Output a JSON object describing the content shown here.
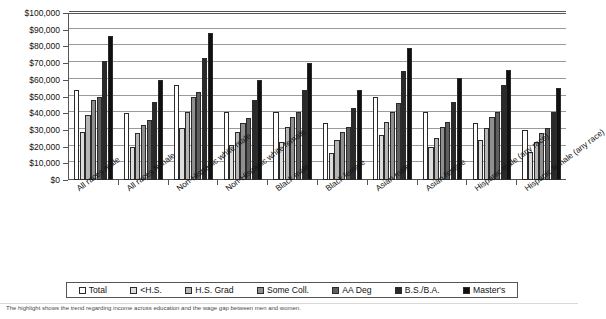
{
  "chart_data": {
    "type": "bar",
    "title": "",
    "subtitle": "",
    "xlabel": "",
    "ylabel": "",
    "ylim": [
      0,
      100000
    ],
    "ytick_values": [
      0,
      10000,
      20000,
      30000,
      40000,
      50000,
      60000,
      70000,
      80000,
      90000,
      100000
    ],
    "ytick_labels": [
      "$0",
      "$10,000",
      "$20,000",
      "$30,000",
      "$40,000",
      "$50,000",
      "$60,000",
      "$70,000",
      "$80,000",
      "$90,000",
      "$100,000"
    ],
    "grid": true,
    "legend_position": "bottom",
    "categories": [
      "All races male",
      "All races female",
      "Non-Hispanic white male",
      "Non-Hispanic white female",
      "Black male",
      "Black female",
      "Asian male",
      "Asian female",
      "Hispanic male (any race)",
      "Hispanic female (any race)"
    ],
    "series": [
      {
        "name": "Total",
        "color": "#ffffff",
        "values": [
          54000,
          40000,
          57000,
          41000,
          41000,
          34000,
          50000,
          41000,
          34000,
          30000
        ]
      },
      {
        "name": "<H.S.",
        "color": "#dcdcdc",
        "values": [
          29000,
          20000,
          31000,
          21000,
          23000,
          16000,
          27000,
          20000,
          24000,
          17000
        ]
      },
      {
        "name": "H.S. Grad",
        "color": "#b5b5b5",
        "values": [
          39000,
          28000,
          41000,
          29000,
          32000,
          24000,
          35000,
          25000,
          31000,
          23000
        ]
      },
      {
        "name": "Some Coll.",
        "color": "#8f8f8f",
        "values": [
          48000,
          33000,
          50000,
          34000,
          38000,
          29000,
          41000,
          32000,
          38000,
          28000
        ]
      },
      {
        "name": "AA Deg",
        "color": "#5e5e5e",
        "values": [
          50000,
          36000,
          53000,
          37000,
          41000,
          32000,
          46000,
          35000,
          41000,
          31000
        ]
      },
      {
        "name": "B.S./B.A.",
        "color": "#2a2a2a",
        "values": [
          71000,
          47000,
          73000,
          48000,
          54000,
          43000,
          65000,
          47000,
          57000,
          41000
        ]
      },
      {
        "name": "Master's",
        "color": "#101010",
        "values": [
          86000,
          60000,
          88000,
          60000,
          70000,
          54000,
          79000,
          61000,
          66000,
          55000
        ]
      }
    ]
  },
  "legend": {
    "items": [
      {
        "label": "Total"
      },
      {
        "label": "<H.S."
      },
      {
        "label": "H.S. Grad"
      },
      {
        "label": "Some Coll."
      },
      {
        "label": "AA Deg"
      },
      {
        "label": "B.S./B.A."
      },
      {
        "label": "Master's"
      }
    ]
  },
  "caption": {
    "text": "The highlight shows the trend regarding income across education and the wage gap between men and women."
  }
}
